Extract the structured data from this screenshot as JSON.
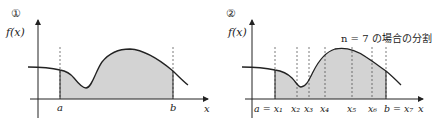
{
  "panels": [
    {
      "marker": "①",
      "y_label": "f(x)",
      "x_label": "x",
      "points": [
        {
          "label": "a"
        },
        {
          "label": "b"
        }
      ]
    },
    {
      "marker": "②",
      "y_label": "f(x)",
      "x_label": "x",
      "caption": "n = 7 の場合の分割",
      "points": [
        {
          "label": "a = x₁"
        },
        {
          "label": "x₂"
        },
        {
          "label": "x₃"
        },
        {
          "label": "x₄"
        },
        {
          "label": "x₅"
        },
        {
          "label": "x₆"
        },
        {
          "label": "b = x₇"
        }
      ]
    }
  ],
  "colors": {
    "fill": "#d3d3d3",
    "stroke": "#222222"
  }
}
